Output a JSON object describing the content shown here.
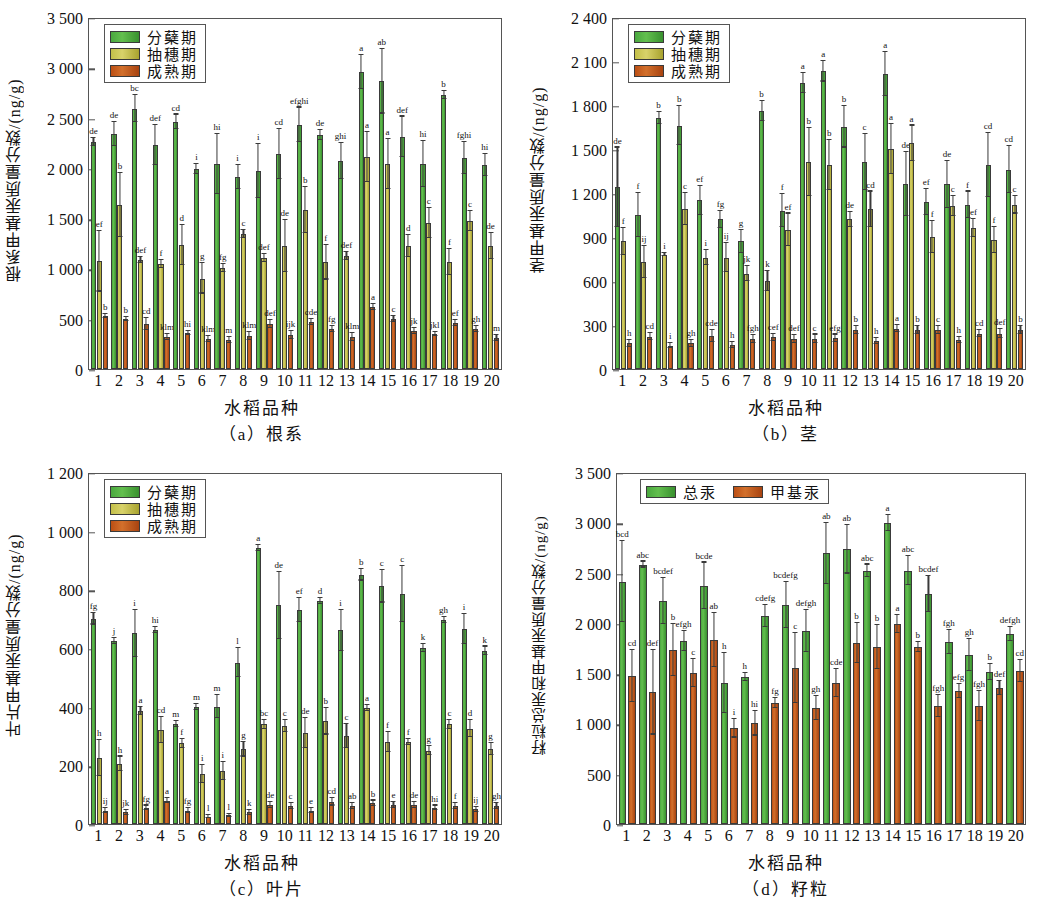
{
  "figure": {
    "x_axis_title": "水稻品种",
    "categories": [
      "1",
      "2",
      "3",
      "4",
      "5",
      "6",
      "7",
      "8",
      "9",
      "10",
      "11",
      "12",
      "13",
      "14",
      "15",
      "16",
      "17",
      "18",
      "19",
      "20"
    ]
  },
  "legend_abc": [
    {
      "label": "分蘖期",
      "color": "#4aa83f",
      "key": "tillering"
    },
    {
      "label": "抽穗期",
      "color": "#c3bf49",
      "key": "heading"
    },
    {
      "label": "成熟期",
      "color": "#bc4f14",
      "key": "maturity"
    }
  ],
  "legend_d": [
    {
      "label": "总汞",
      "color": "#4aa83f",
      "key": "total_hg"
    },
    {
      "label": "甲基汞",
      "color": "#bc4f14",
      "key": "methyl_hg"
    }
  ],
  "chart_data": [
    {
      "id": "a",
      "type": "bar",
      "title": "（a）根系",
      "ylabel": "根系甲基汞质量分数/(ng/g)",
      "xlabel": "水稻品种",
      "ylim": [
        0,
        3500
      ],
      "yticks": [
        0,
        500,
        1000,
        1500,
        2000,
        2500,
        3000,
        3500
      ],
      "ytick_labels": [
        "0",
        "500",
        "1 000",
        "1 500",
        "2 000",
        "2 500",
        "3 000",
        "3 500"
      ],
      "grid": false,
      "legend_position": "top-left",
      "categories": [
        "1",
        "2",
        "3",
        "4",
        "5",
        "6",
        "7",
        "8",
        "9",
        "10",
        "11",
        "12",
        "13",
        "14",
        "15",
        "16",
        "17",
        "18",
        "19",
        "20"
      ],
      "series": [
        {
          "name": "分蘖期",
          "values": [
            2260,
            2340,
            2590,
            2230,
            2460,
            1990,
            2040,
            1910,
            1970,
            2140,
            2430,
            2330,
            2070,
            2950,
            2860,
            2310,
            2040,
            2720,
            2100,
            2030
          ],
          "errors": [
            40,
            120,
            130,
            200,
            70,
            50,
            300,
            120,
            270,
            250,
            170,
            50,
            180,
            170,
            320,
            200,
            230,
            40,
            160,
            110
          ],
          "sig": [
            "de",
            "de",
            "bc",
            "def",
            "cd",
            "i",
            "hi",
            "i",
            "i",
            "cd",
            "efghi",
            "de",
            "ghi",
            "a",
            "ab",
            "def",
            "hi",
            "b",
            "fghi",
            "hi"
          ]
        },
        {
          "name": "抽穗期",
          "values": [
            1070,
            1630,
            1080,
            1040,
            1230,
            900,
            1000,
            1340,
            1100,
            1220,
            1580,
            1060,
            1120,
            2110,
            2040,
            1220,
            1450,
            1060,
            1470,
            1220
          ],
          "errors": [
            300,
            320,
            30,
            40,
            200,
            150,
            40,
            40,
            40,
            260,
            230,
            170,
            40,
            250,
            250,
            110,
            150,
            130,
            100,
            130
          ],
          "sig": [
            "ef",
            "b",
            "def",
            "f",
            "d",
            "g",
            "fg",
            "c",
            "def",
            "de",
            "b",
            "f",
            "def",
            "a",
            "a",
            "d",
            "c",
            "f",
            "c",
            "de"
          ]
        },
        {
          "name": "成熟期",
          "values": [
            530,
            500,
            450,
            320,
            360,
            300,
            290,
            330,
            450,
            340,
            470,
            400,
            320,
            620,
            500,
            380,
            350,
            460,
            400,
            310
          ],
          "errors": [
            20,
            20,
            60,
            30,
            20,
            30,
            30,
            40,
            40,
            40,
            30,
            30,
            40,
            30,
            30,
            30,
            20,
            30,
            30,
            30
          ],
          "sig": [
            "b",
            "b",
            "cd",
            "klm",
            "hi",
            "klm",
            "m",
            "klm",
            "def",
            "ijk",
            "cde",
            "fg",
            "klm",
            "a",
            "c",
            "jk",
            "jkl",
            "ef",
            "gh",
            "m"
          ]
        }
      ]
    },
    {
      "id": "b",
      "type": "bar",
      "title": "（b）茎",
      "ylabel": "茎甲基汞质量分数/(ng/g)",
      "xlabel": "水稻品种",
      "ylim": [
        0,
        2400
      ],
      "yticks": [
        0,
        300,
        600,
        900,
        1200,
        1500,
        1800,
        2100,
        2400
      ],
      "ytick_labels": [
        "0",
        "300",
        "600",
        "900",
        "1 200",
        "1 500",
        "1 800",
        "2 100",
        "2 400"
      ],
      "grid": false,
      "legend_position": "top-left",
      "categories": [
        "1",
        "2",
        "3",
        "4",
        "5",
        "6",
        "7",
        "8",
        "9",
        "10",
        "11",
        "12",
        "13",
        "14",
        "15",
        "16",
        "17",
        "18",
        "19",
        "20"
      ],
      "series": [
        {
          "name": "分蘖期",
          "values": [
            1240,
            1050,
            1710,
            1660,
            1150,
            1020,
            870,
            1760,
            1080,
            1950,
            2030,
            1650,
            1410,
            2010,
            1260,
            1140,
            1260,
            1120,
            1390,
            1360
          ],
          "errors": [
            270,
            150,
            40,
            130,
            100,
            60,
            80,
            70,
            110,
            70,
            70,
            140,
            190,
            150,
            220,
            90,
            160,
            90,
            220,
            160
          ],
          "sig": [
            "de",
            "f",
            "b",
            "b",
            "ef",
            "fg",
            "g",
            "b",
            "f",
            "a",
            "a",
            "b",
            "c",
            "a",
            "de",
            "ef",
            "de",
            "f",
            "cd",
            "cd"
          ]
        },
        {
          "name": "抽穗期",
          "values": [
            870,
            730,
            780,
            1090,
            760,
            760,
            650,
            600,
            950,
            1410,
            1390,
            1020,
            1090,
            1500,
            1540,
            900,
            1110,
            960,
            880,
            1120
          ],
          "errors": [
            90,
            110,
            10,
            110,
            50,
            100,
            50,
            70,
            110,
            230,
            170,
            50,
            120,
            170,
            120,
            110,
            70,
            60,
            90,
            60
          ],
          "sig": [
            "f",
            "ij",
            "i",
            "c",
            "i",
            "ij",
            "jk",
            "k",
            "ef",
            "b",
            "b",
            "de",
            "cd",
            "a",
            "a",
            "f",
            "c",
            "ef",
            "f",
            "c"
          ]
        },
        {
          "name": "成熟期",
          "values": [
            175,
            220,
            160,
            175,
            225,
            165,
            205,
            215,
            205,
            205,
            210,
            265,
            190,
            275,
            265,
            265,
            200,
            240,
            240,
            265
          ],
          "errors": [
            25,
            25,
            15,
            25,
            40,
            20,
            25,
            25,
            25,
            30,
            25,
            25,
            20,
            25,
            25,
            25,
            20,
            25,
            30,
            25
          ],
          "sig": [
            "h",
            "cd",
            "i",
            "gh",
            "cde",
            "h",
            "fgh",
            "cef",
            "def",
            "c",
            "efg",
            "b",
            "h",
            "a",
            "b",
            "c",
            "h",
            "cd",
            "def",
            "b"
          ]
        }
      ]
    },
    {
      "id": "c",
      "type": "bar",
      "title": "（c）叶片",
      "ylabel": "叶片甲基汞质量分数/(ng/g)",
      "xlabel": "水稻品种",
      "ylim": [
        0,
        1200
      ],
      "yticks": [
        0,
        200,
        400,
        600,
        800,
        1000,
        1200
      ],
      "ytick_labels": [
        "0",
        "200",
        "400",
        "600",
        "800",
        "1 000",
        "1 200"
      ],
      "grid": false,
      "legend_position": "top-left",
      "categories": [
        "1",
        "2",
        "3",
        "4",
        "5",
        "6",
        "7",
        "8",
        "9",
        "10",
        "11",
        "12",
        "13",
        "14",
        "15",
        "16",
        "17",
        "18",
        "19",
        "20"
      ],
      "series": [
        {
          "name": "分蘖期",
          "values": [
            700,
            625,
            650,
            660,
            340,
            400,
            400,
            550,
            940,
            745,
            730,
            760,
            660,
            850,
            810,
            785,
            600,
            695,
            665,
            590
          ],
          "errors": [
            20,
            10,
            80,
            10,
            10,
            10,
            40,
            50,
            10,
            115,
            40,
            10,
            70,
            20,
            55,
            95,
            15,
            10,
            50,
            15
          ],
          "sig": [
            "fg",
            "j",
            "i",
            "hi",
            "m",
            "m",
            "m",
            "l",
            "a",
            "de",
            "ef",
            "d",
            "i",
            "b",
            "c",
            "c",
            "k",
            "gh",
            "i",
            "k"
          ]
        },
        {
          "name": "抽穗期",
          "values": [
            225,
            205,
            385,
            320,
            275,
            170,
            180,
            255,
            340,
            335,
            310,
            350,
            300,
            395,
            280,
            280,
            250,
            340,
            325,
            255
          ],
          "errors": [
            60,
            25,
            15,
            45,
            15,
            30,
            30,
            25,
            15,
            20,
            50,
            45,
            40,
            10,
            35,
            10,
            15,
            15,
            30,
            20
          ],
          "sig": [
            "h",
            "h",
            "a",
            "cd",
            "f",
            "i",
            "i",
            "g",
            "bc",
            "c",
            "de",
            "b",
            "c",
            "a",
            "f",
            "f",
            "g",
            "c",
            "d",
            "g"
          ]
        },
        {
          "name": "成熟期",
          "values": [
            45,
            40,
            55,
            80,
            45,
            25,
            30,
            40,
            65,
            60,
            45,
            75,
            60,
            70,
            65,
            65,
            55,
            60,
            50,
            60
          ],
          "errors": [
            8,
            8,
            8,
            10,
            8,
            5,
            5,
            8,
            10,
            10,
            8,
            12,
            10,
            10,
            10,
            10,
            8,
            10,
            8,
            10
          ],
          "sig": [
            "ij",
            "jk",
            "fg",
            "a",
            "fg",
            "l",
            "l",
            "k",
            "de",
            "c",
            "e",
            "cd",
            "ab",
            "b",
            "e",
            "de",
            "hi",
            "f",
            "ij",
            "gh"
          ]
        }
      ]
    },
    {
      "id": "d",
      "type": "bar",
      "title": "（d）籽粒",
      "ylabel": "籽粒总汞和甲基汞质量分数/(ng/g)",
      "xlabel": "水稻品种",
      "ylim": [
        0,
        3500
      ],
      "yticks": [
        0,
        500,
        1000,
        1500,
        2000,
        2500,
        3000,
        3500
      ],
      "ytick_labels": [
        "0",
        "500",
        "1 000",
        "1 500",
        "2 000",
        "2 500",
        "3 000",
        "3 500"
      ],
      "grid": false,
      "legend_position": "top-left",
      "categories": [
        "1",
        "2",
        "3",
        "4",
        "5",
        "6",
        "7",
        "8",
        "9",
        "10",
        "11",
        "12",
        "13",
        "14",
        "15",
        "16",
        "17",
        "18",
        "19",
        "20"
      ],
      "series": [
        {
          "name": "总汞",
          "values": [
            2410,
            2580,
            2220,
            1820,
            2370,
            1400,
            1460,
            2070,
            2180,
            1920,
            2690,
            2730,
            2520,
            2990,
            2520,
            2290,
            1810,
            1680,
            1510,
            1890
          ],
          "errors": [
            400,
            30,
            230,
            100,
            230,
            300,
            40,
            110,
            230,
            210,
            300,
            240,
            60,
            80,
            140,
            180,
            120,
            160,
            80,
            70
          ],
          "sig": [
            "bcd",
            "abc",
            "bcdef",
            "efgh",
            "bcde",
            "h",
            "h",
            "cdefg",
            "bcdefg",
            "defgh",
            "ab",
            "ab",
            "abc",
            "a",
            "abc",
            "bcdef",
            "fgh",
            "gh",
            "b",
            "defgh"
          ]
        },
        {
          "name": "甲基汞",
          "values": [
            1470,
            1310,
            1730,
            1500,
            1830,
            950,
            1000,
            1200,
            1550,
            1150,
            1400,
            1800,
            1760,
            1990,
            1760,
            1170,
            1320,
            1170,
            1350,
            1520
          ],
          "errors": [
            260,
            420,
            260,
            140,
            270,
            90,
            120,
            50,
            350,
            120,
            140,
            200,
            220,
            90,
            50,
            110,
            70,
            150,
            70,
            110
          ],
          "sig": [
            "cd",
            "def",
            "b",
            "c",
            "ab",
            "i",
            "hi",
            "fg",
            "c",
            "gh",
            "cde",
            "b",
            "b",
            "a",
            "b",
            "fgh",
            "efg",
            "fgh",
            "def",
            "cd"
          ]
        }
      ]
    }
  ]
}
